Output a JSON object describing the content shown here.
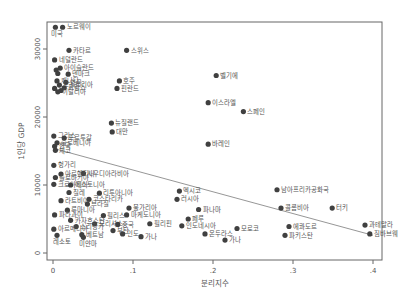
{
  "chart_data": {
    "type": "scatter",
    "title": "",
    "xlabel": "분리지수",
    "ylabel": "1인당 GDP",
    "xlim": [
      0,
      0.4
    ],
    "ylim": [
      0,
      32000
    ],
    "xticks": [
      0,
      0.1,
      0.2,
      0.3,
      0.4
    ],
    "xtick_labels": [
      "0",
      ".1",
      ".2",
      ".3",
      ".4"
    ],
    "yticks": [
      0,
      10000,
      20000,
      30000
    ],
    "ytick_labels": [
      "0",
      "10000",
      "20000",
      "30000"
    ],
    "grid": false,
    "legend": null,
    "fit_line": {
      "x": [
        0,
        0.4
      ],
      "y": [
        15400,
        2600
      ]
    },
    "points": [
      {
        "label": "노르웨이",
        "x": 0.012,
        "y": 33200
      },
      {
        "label": "미국",
        "x": 0.003,
        "y": 33200,
        "label_below": true
      },
      {
        "label": "카타르",
        "x": 0.02,
        "y": 29800
      },
      {
        "label": "스위스",
        "x": 0.092,
        "y": 29800
      },
      {
        "label": "네덜란드",
        "x": 0.002,
        "y": 28400
      },
      {
        "label": "아이슬란드",
        "x": 0.009,
        "y": 27200
      },
      {
        "label": "덴마크",
        "x": 0.019,
        "y": 26300
      },
      {
        "label": "",
        "x": 0.004,
        "y": 26900
      },
      {
        "label": "",
        "x": 0.006,
        "y": 26400
      },
      {
        "label": "캐나다",
        "x": 0.005,
        "y": 25300
      },
      {
        "label": "영국",
        "x": 0.016,
        "y": 25100
      },
      {
        "label": "오스트리아",
        "x": 0.008,
        "y": 24700
      },
      {
        "label": "프랑스",
        "x": 0.014,
        "y": 24300
      },
      {
        "label": "이탈리아",
        "x": 0.006,
        "y": 23700
      },
      {
        "label": "",
        "x": 0.002,
        "y": 24200
      },
      {
        "label": "",
        "x": 0.01,
        "y": 23900
      },
      {
        "label": "호주",
        "x": 0.083,
        "y": 25300
      },
      {
        "label": "핀란드",
        "x": 0.08,
        "y": 24200
      },
      {
        "label": "벨기에",
        "x": 0.204,
        "y": 26100
      },
      {
        "label": "이스라엘",
        "x": 0.194,
        "y": 22100
      },
      {
        "label": "스페인",
        "x": 0.238,
        "y": 20800
      },
      {
        "label": "뉴질랜드",
        "x": 0.073,
        "y": 19100
      },
      {
        "label": "대만",
        "x": 0.074,
        "y": 17800
      },
      {
        "label": "그리스",
        "x": 0.001,
        "y": 17200
      },
      {
        "label": "포르투갈",
        "x": 0.014,
        "y": 16900
      },
      {
        "label": "슬로베니아",
        "x": 0.005,
        "y": 16200
      },
      {
        "label": "한국",
        "x": 0.002,
        "y": 15700
      },
      {
        "label": "체코",
        "x": 0.003,
        "y": 15100
      },
      {
        "label": "바레인",
        "x": 0.194,
        "y": 16000
      },
      {
        "label": "헝가리",
        "x": 0.001,
        "y": 12900
      },
      {
        "label": "사우디아라비아",
        "x": 0.038,
        "y": 11700
      },
      {
        "label": "아르헨티나",
        "x": 0.01,
        "y": 11600
      },
      {
        "label": "슬로바키아",
        "x": 0.003,
        "y": 11100
      },
      {
        "label": "크로아티아",
        "x": 0.001,
        "y": 10100
      },
      {
        "label": "에스토니아",
        "x": 0.022,
        "y": 10000
      },
      {
        "label": "칠레",
        "x": 0.02,
        "y": 8900
      },
      {
        "label": "리투아니아",
        "x": 0.058,
        "y": 8800
      },
      {
        "label": "라트비아",
        "x": 0.01,
        "y": 7700
      },
      {
        "label": "코스타리카",
        "x": 0.045,
        "y": 7900
      },
      {
        "label": "브라질",
        "x": 0.043,
        "y": 7200
      },
      {
        "label": "멕시코",
        "x": 0.158,
        "y": 9100
      },
      {
        "label": "러시아",
        "x": 0.155,
        "y": 7900
      },
      {
        "label": "루마니아",
        "x": 0.018,
        "y": 6300
      },
      {
        "label": "불가리아",
        "x": 0.095,
        "y": 6600
      },
      {
        "label": "필리스",
        "x": 0.063,
        "y": 5500
      },
      {
        "label": "마케도니아",
        "x": 0.092,
        "y": 5600
      },
      {
        "label": "파라과이",
        "x": 0.002,
        "y": 5600
      },
      {
        "label": "카자흐스탄",
        "x": 0.022,
        "y": 4800
      },
      {
        "label": "모리셔스",
        "x": 0.052,
        "y": 4300
      },
      {
        "label": "중국",
        "x": 0.081,
        "y": 4200
      },
      {
        "label": "필리핀",
        "x": 0.121,
        "y": 4300
      },
      {
        "label": "스리랑카",
        "x": 0.029,
        "y": 3900
      },
      {
        "label": "아르메니아",
        "x": 0.001,
        "y": 3500
      },
      {
        "label": "부탄",
        "x": 0.075,
        "y": 3300
      },
      {
        "label": "인도",
        "x": 0.087,
        "y": 2800
      },
      {
        "label": "가나",
        "x": 0.11,
        "y": 2400
      },
      {
        "label": "베트남",
        "x": 0.036,
        "y": 2700
      },
      {
        "label": "미얀마",
        "x": 0.038,
        "y": 2300,
        "label_below": true
      },
      {
        "label": "레소토",
        "x": 0.005,
        "y": 2600,
        "label_below": true
      },
      {
        "label": "페루",
        "x": 0.169,
        "y": 5000
      },
      {
        "label": "파나마",
        "x": 0.182,
        "y": 6400
      },
      {
        "label": "인도네시아",
        "x": 0.161,
        "y": 4000
      },
      {
        "label": "온두라스",
        "x": 0.19,
        "y": 2800
      },
      {
        "label": "모로코",
        "x": 0.23,
        "y": 3600
      },
      {
        "label": "가나",
        "x": 0.215,
        "y": 1900
      },
      {
        "label": "남아프리카공화국",
        "x": 0.28,
        "y": 9300
      },
      {
        "label": "콜롬비아",
        "x": 0.285,
        "y": 6600
      },
      {
        "label": "터키",
        "x": 0.349,
        "y": 6600
      },
      {
        "label": "에콰도르",
        "x": 0.295,
        "y": 3900
      },
      {
        "label": "파키스탄",
        "x": 0.29,
        "y": 2600
      },
      {
        "label": "과테말라",
        "x": 0.39,
        "y": 4100
      },
      {
        "label": "짐바브웨",
        "x": 0.396,
        "y": 2800
      }
    ]
  }
}
